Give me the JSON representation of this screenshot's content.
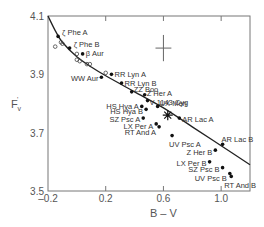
{
  "chart_data": {
    "type": "scatter",
    "title": "",
    "xlabel": "B – V",
    "ylabel": "F'v",
    "xlim": [
      -0.2,
      1.2
    ],
    "ylim": [
      3.5,
      4.1
    ],
    "xticks": [
      -0.2,
      0.2,
      0.6,
      1.0
    ],
    "xtick_labels": [
      "–0.2",
      "0.2",
      "0.6",
      "1.0"
    ],
    "yticks": [
      3.5,
      3.7,
      3.9,
      4.1
    ],
    "ytick_labels": [
      "3.5",
      "3.7",
      "3.9",
      "4.1"
    ],
    "grid": false,
    "legend": null,
    "series": [
      {
        "name": "Eclipsing binary components",
        "marker": "filled-circle",
        "points": [
          {
            "label": "ζ Phe A",
            "x": -0.13,
            "y": 4.03
          },
          {
            "label": "ζ Phe B",
            "x": -0.05,
            "y": 3.99
          },
          {
            "label": "β Aur",
            "x": 0.04,
            "y": 3.97
          },
          {
            "label": "WW Aur",
            "x": 0.17,
            "y": 3.89
          },
          {
            "label": "RR Lyn A",
            "x": 0.24,
            "y": 3.9
          },
          {
            "label": "RR Lyn B",
            "x": 0.31,
            "y": 3.87
          },
          {
            "label": "ZZ Boo",
            "x": 0.38,
            "y": 3.84
          },
          {
            "label": "Z Her A",
            "x": 0.47,
            "y": 3.83
          },
          {
            "label": "V 1143 Cyg",
            "x": 0.49,
            "y": 3.81
          },
          {
            "label": "UX Men",
            "x": 0.56,
            "y": 3.79
          },
          {
            "label": "HS Hya A",
            "x": 0.45,
            "y": 3.79
          },
          {
            "label": "HS Hya B",
            "x": 0.48,
            "y": 3.78
          },
          {
            "label": "SZ Psc A",
            "x": 0.46,
            "y": 3.75
          },
          {
            "label": "AR Lac A",
            "x": 0.71,
            "y": 3.75
          },
          {
            "label": "LX Per A",
            "x": 0.55,
            "y": 3.73
          },
          {
            "label": "RT And A",
            "x": 0.57,
            "y": 3.72
          },
          {
            "label": "UV Psc A",
            "x": 0.66,
            "y": 3.69
          },
          {
            "label": "AR Lac B",
            "x": 1.01,
            "y": 3.66
          },
          {
            "label": "Z Her B",
            "x": 0.96,
            "y": 3.64
          },
          {
            "label": "LX Per B",
            "x": 0.92,
            "y": 3.6
          },
          {
            "label": "SZ Psc B",
            "x": 1.01,
            "y": 3.58
          },
          {
            "label": "UV Psc B",
            "x": 1.06,
            "y": 3.56
          },
          {
            "label": "RT And B",
            "x": 1.07,
            "y": 3.55
          }
        ]
      },
      {
        "name": "Open circles (other calibrators)",
        "marker": "open-circle",
        "points": [
          {
            "x": -0.15,
            "y": 3.995
          },
          {
            "x": -0.11,
            "y": 4.01
          },
          {
            "x": -0.1,
            "y": 4.005
          },
          {
            "x": 0.0,
            "y": 3.97
          },
          {
            "x": 0.0,
            "y": 3.95
          },
          {
            "x": 0.02,
            "y": 3.945
          },
          {
            "x": 0.07,
            "y": 3.935
          },
          {
            "x": 0.09,
            "y": 3.935
          },
          {
            "x": 0.2,
            "y": 3.905
          }
        ]
      },
      {
        "name": "Sun",
        "marker": "star",
        "points": [
          {
            "x": 0.63,
            "y": 3.76
          }
        ]
      }
    ],
    "curve": {
      "name": "Calibration relation",
      "points": [
        {
          "x": -0.2,
          "y": 4.1
        },
        {
          "x": -0.15,
          "y": 4.05
        },
        {
          "x": -0.1,
          "y": 4.01
        },
        {
          "x": 0.0,
          "y": 3.96
        },
        {
          "x": 0.1,
          "y": 3.925
        },
        {
          "x": 0.2,
          "y": 3.895
        },
        {
          "x": 0.4,
          "y": 3.84
        },
        {
          "x": 0.6,
          "y": 3.785
        },
        {
          "x": 0.8,
          "y": 3.72
        },
        {
          "x": 1.0,
          "y": 3.655
        },
        {
          "x": 1.2,
          "y": 3.59
        }
      ]
    },
    "annotations": [
      {
        "type": "error-bar-cross",
        "x": 0.6,
        "y": 3.99,
        "x_err": 0.055,
        "y_err": 0.045
      }
    ]
  }
}
